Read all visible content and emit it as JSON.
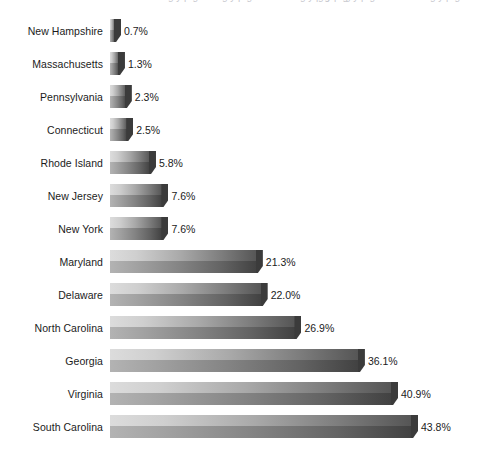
{
  "chart_data": {
    "type": "bar",
    "orientation": "horizontal",
    "title": "",
    "subtitle": "",
    "xlabel": "",
    "ylabel": "",
    "grid": false,
    "legend": false,
    "value_suffix": "%",
    "xlim": [
      0,
      43.8
    ],
    "categories": [
      "New Hampshire",
      "Massachusetts",
      "Pennsylvania",
      "Connecticut",
      "Rhode Island",
      "New Jersey",
      "New York",
      "Maryland",
      "Delaware",
      "North Carolina",
      "Georgia",
      "Virginia",
      "South Carolina"
    ],
    "values": [
      0.7,
      1.3,
      2.3,
      2.5,
      5.8,
      7.6,
      7.6,
      21.3,
      22.0,
      26.9,
      36.1,
      40.9,
      43.8
    ],
    "value_labels": [
      "0.7%",
      "1.3%",
      "2.3%",
      "2.5%",
      "5.8%",
      "7.6%",
      "7.6%",
      "21.3%",
      "22.0%",
      "26.9%",
      "36.1%",
      "40.9%",
      "43.8%"
    ]
  },
  "style": {
    "background": "#ffffff",
    "bar_light": "#dcdcdc",
    "bar_dark": "#414141",
    "bar_bevel": "#3b3b3b",
    "text_color": "#1b1b1b"
  },
  "top_clipped_fragments": [
    "",
    "",
    "",
    "",
    ""
  ]
}
